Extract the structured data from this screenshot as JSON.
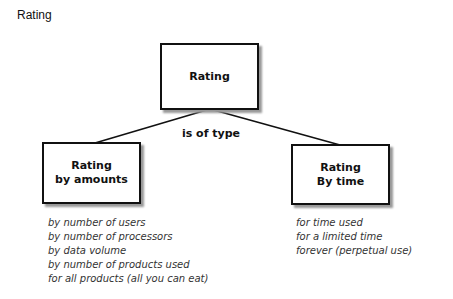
{
  "title": "Rating",
  "nodes": {
    "root": {
      "lines": [
        "Rating"
      ]
    },
    "left": {
      "lines": [
        "Rating",
        "by amounts"
      ]
    },
    "right": {
      "lines": [
        "Rating",
        "By time"
      ]
    }
  },
  "relation_label": "is of type",
  "left_list": [
    "by number of users",
    "by number of processors",
    "by data volume",
    "by number of products used",
    "for all products (all you can eat)"
  ],
  "right_list": [
    "for time used",
    "for a limited time",
    "forever (perpetual use)"
  ]
}
